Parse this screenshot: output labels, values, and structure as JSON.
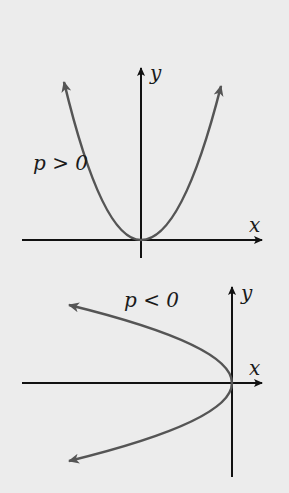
{
  "figure": {
    "top_graph": {
      "condition_label": "p > 0",
      "x_axis_label": "x",
      "y_axis_label": "y",
      "description": "Parabola opening upward with vertex at origin"
    },
    "bottom_graph": {
      "condition_label": "p < 0",
      "x_axis_label": "x",
      "y_axis_label": "y",
      "description": "Parabola opening left with vertex at origin"
    },
    "colors": {
      "background": "#ececec",
      "axis": "#111111",
      "curve": "#555555"
    }
  }
}
